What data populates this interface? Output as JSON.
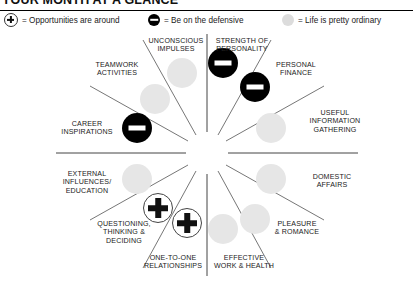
{
  "header": {
    "title": "YOUR MONTH AT A GLANCE"
  },
  "legend": {
    "items": [
      {
        "symbol": "plus-icon",
        "label": "= Opportunities are around"
      },
      {
        "symbol": "minus-icon",
        "label": "= Be on the defensive"
      },
      {
        "symbol": "neutral-icon",
        "label": "= Life is pretty ordinary"
      }
    ]
  },
  "wheel": {
    "sectors": [
      {
        "label": "UNCONSCIOUS\nIMPULSES",
        "marker": "neutral"
      },
      {
        "label": "STRENGTH OF\nPERSONALITY",
        "marker": "minus"
      },
      {
        "label": "PERSONAL\nFINANCE",
        "marker": "minus"
      },
      {
        "label": "USEFUL\nINFORMATION\nGATHERING",
        "marker": "neutral"
      },
      {
        "label": "DOMESTIC\nAFFAIRS",
        "marker": "neutral"
      },
      {
        "label": "PLEASURE\n& ROMANCE",
        "marker": "neutral"
      },
      {
        "label": "EFFECTIVE\nWORK & HEALTH",
        "marker": "neutral"
      },
      {
        "label": "ONE-TO-ONE\nRELATIONSHIPS",
        "marker": "plus"
      },
      {
        "label": "QUESTIONING,\nTHINKING &\nDECIDING",
        "marker": "plus"
      },
      {
        "label": "EXTERNAL\nINFLUENCES/\nEDUCATION",
        "marker": "neutral"
      },
      {
        "label": "CAREER\nINSPIRATIONS",
        "marker": "minus"
      },
      {
        "label": "TEAMWORK\nACTIVITIES",
        "marker": "neutral"
      }
    ]
  },
  "colors": {
    "negative": "#000000",
    "positive": "#ffffff",
    "neutral": "#e6e6e6",
    "rule": "#000000",
    "spoke": "#555555"
  }
}
